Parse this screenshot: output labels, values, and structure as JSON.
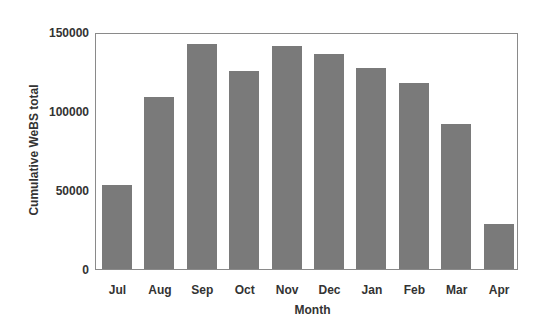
{
  "chart_data": {
    "type": "bar",
    "title": "",
    "xlabel": "Month",
    "ylabel": "Cumulative WeBS total",
    "categories": [
      "Jul",
      "Aug",
      "Sep",
      "Oct",
      "Nov",
      "Dec",
      "Jan",
      "Feb",
      "Mar",
      "Apr"
    ],
    "values": [
      54000,
      110000,
      144000,
      127000,
      143000,
      138000,
      129000,
      119000,
      93000,
      29000
    ],
    "ylim": [
      0,
      150000
    ],
    "yticks": [
      0,
      50000,
      100000,
      150000
    ],
    "ytick_labels": [
      "0",
      "50000",
      "100000",
      "150000"
    ],
    "grid": false,
    "legend": null,
    "bar_color": "#7a7a7a",
    "frame_color": "#8a8a8a"
  }
}
